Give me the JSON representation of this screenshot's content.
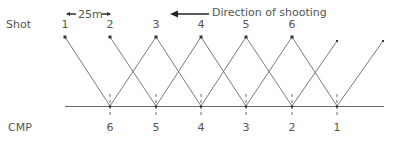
{
  "diagram": {
    "shot_label": "Shot",
    "cmp_label": "CMP",
    "spacing_label": "25m",
    "direction_label": "Direction of shooting",
    "shots": [
      {
        "label": "1",
        "x": 65
      },
      {
        "label": "2",
        "x": 110
      },
      {
        "label": "3",
        "x": 156
      },
      {
        "label": "4",
        "x": 201
      },
      {
        "label": "5",
        "x": 246
      },
      {
        "label": "6",
        "x": 292
      }
    ],
    "receivers_unlabeled_x": [
      337,
      383
    ],
    "cmps": [
      {
        "label": "6",
        "x": 110
      },
      {
        "label": "5",
        "x": 156
      },
      {
        "label": "4",
        "x": 201
      },
      {
        "label": "3",
        "x": 246
      },
      {
        "label": "2",
        "x": 292
      },
      {
        "label": "1",
        "x": 337
      }
    ],
    "colors": {
      "line": "#6a6a6a",
      "text": "#555555",
      "arrow": "#222222"
    }
  }
}
